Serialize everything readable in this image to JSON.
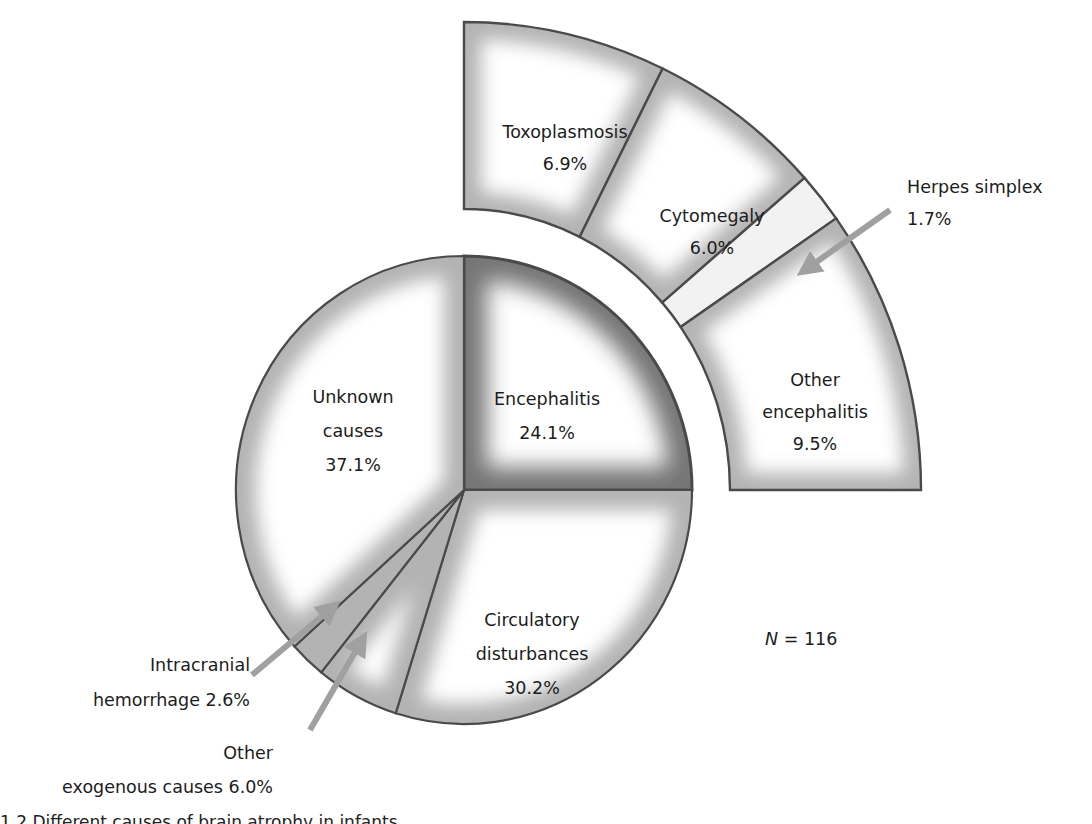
{
  "chart_data": {
    "type": "pie",
    "title": "",
    "total_label": "N = 116",
    "total_n": 116,
    "slices": [
      {
        "name": "Encephalitis",
        "label_lines": [
          "Encephalitis",
          "24.1%"
        ],
        "value": 24.1,
        "emphasis": true
      },
      {
        "name": "Circulatory disturbances",
        "label_lines": [
          "Circulatory",
          "disturbances",
          "30.2%"
        ],
        "value": 30.2
      },
      {
        "name": "Other exogenous causes",
        "label_lines": [
          "Other",
          "exogenous causes 6.0%"
        ],
        "value": 6.0,
        "callout": true
      },
      {
        "name": "Intracranial hemorrhage",
        "label_lines": [
          "Intracranial",
          "hemorrhage 2.6%"
        ],
        "value": 2.6,
        "callout": true
      },
      {
        "name": "Unknown causes",
        "label_lines": [
          "Unknown",
          "causes",
          "37.1%"
        ],
        "value": 37.1
      }
    ],
    "breakdown": {
      "parent": "Encephalitis",
      "slices": [
        {
          "name": "Toxoplasmosis",
          "label_lines": [
            "Toxoplasmosis",
            "6.9%"
          ],
          "value": 6.9
        },
        {
          "name": "Cytomegaly",
          "label_lines": [
            "Cytomegaly",
            "6.0%"
          ],
          "value": 6.0
        },
        {
          "name": "Herpes simplex",
          "label_lines": [
            "Herpes simplex",
            "1.7%"
          ],
          "value": 1.7,
          "callout": true
        },
        {
          "name": "Other encephalitis",
          "label_lines": [
            "Other",
            "encephalitis",
            "9.5%"
          ],
          "value": 9.5
        }
      ]
    },
    "colors": {
      "outline": "#4a4a4a",
      "edge_shade": "#9a9a9a",
      "emphasis_shade": "#6e6e6e",
      "fill": "#ffffff",
      "arrow": "#a0a0a0"
    }
  },
  "caption": {
    "text": "1.2   Different causes of brain atrophy in infants"
  }
}
